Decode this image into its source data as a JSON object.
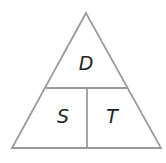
{
  "diagram": {
    "line_color": "#9a9a9a",
    "text_color": "#222222",
    "top_label": "D",
    "bottom_left_label": "S",
    "bottom_right_label": "T"
  }
}
